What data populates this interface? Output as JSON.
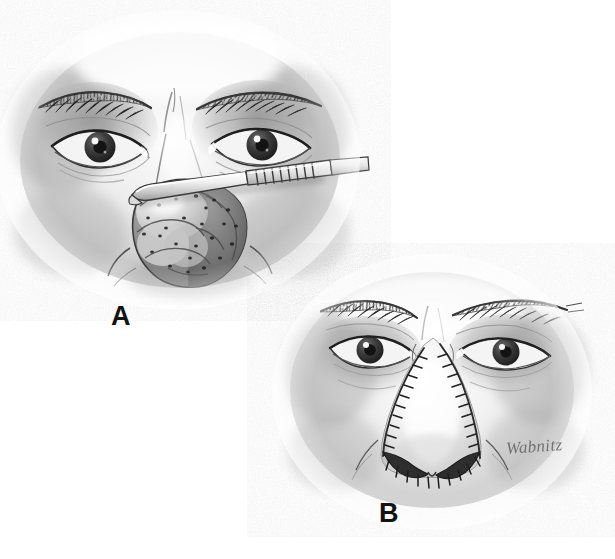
{
  "figure": {
    "medium": "graphite-pencil-medical-illustration",
    "background_color": "#ffffff",
    "width": 615,
    "height": 559,
    "ink_color": "#2b2b2b",
    "midtone_color": "#8d8d8d",
    "shadow_color": "#4a4a4a"
  },
  "panels": [
    {
      "id": "A",
      "label": "A",
      "caption_position": "below-left",
      "description": "Pre-operative view: midface of an older man showing a large lobulated bulbous rhinophyma of the nasal tip with prominent dilated pores, a shave-excision blade held horizontally across the upper nose",
      "label_x": 111,
      "label_y": 303,
      "contents": [
        "left-eye",
        "right-eye",
        "left-eyebrow",
        "right-eyebrow",
        "glabella",
        "nasal-dorsum",
        "rhinophyma-mass",
        "shave-excision-blade",
        "cheeks"
      ]
    },
    {
      "id": "B",
      "label": "B",
      "caption_position": "below-left",
      "description": "Post-operative view: same midface after excision, the reshaped nose outlined by a running line of interrupted sutures along the nasal sidewalls, tip and alar rims",
      "label_x": 379,
      "label_y": 500,
      "contents": [
        "left-eye",
        "right-eye",
        "left-eyebrow",
        "right-eyebrow",
        "glabella",
        "reconstructed-nose",
        "suture-line",
        "nostril-rims",
        "cheeks"
      ]
    }
  ],
  "signature": {
    "text": "Wabnitz",
    "x": 506,
    "y": 437,
    "rotation_deg": -4,
    "color": "#6e6e6e"
  },
  "annotations": {
    "instrument_name": "shave-excision-blade",
    "lesion_name": "rhinophyma",
    "suture_type": "interrupted sutures"
  }
}
